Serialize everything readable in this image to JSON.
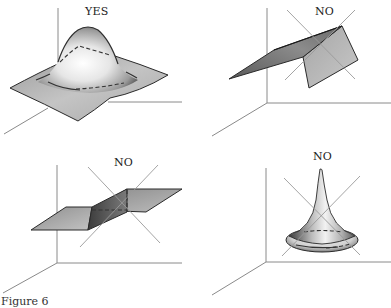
{
  "figure": {
    "caption": "Figure 6",
    "panels": [
      {
        "id": "top-left",
        "label": "YES",
        "shape": "smooth-gaussian-bump-surface",
        "crossed_out": false
      },
      {
        "id": "top-right",
        "label": "NO",
        "shape": "folded-plane-with-vertical-flap",
        "crossed_out": true
      },
      {
        "id": "bottom-left",
        "label": "NO",
        "shape": "step-discontinuity-surface",
        "crossed_out": true
      },
      {
        "id": "bottom-right",
        "label": "NO",
        "shape": "sharp-spike-horn-surface",
        "crossed_out": true
      }
    ],
    "colors": {
      "axis": "#8a8a8a",
      "cross": "#9a9a9a",
      "surface_light": "#f4f4f4",
      "surface_mid": "#bdbdbd",
      "surface_dark": "#6e6e6e",
      "edge": "#2a2a2a"
    }
  }
}
